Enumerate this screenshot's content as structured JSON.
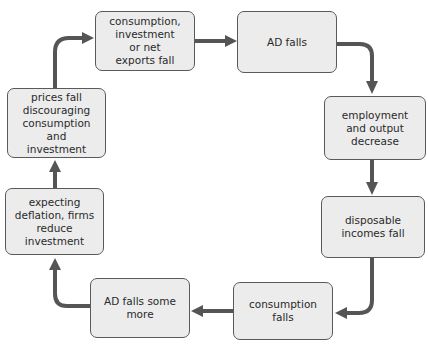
{
  "diagram": {
    "type": "cycle-flowchart",
    "colors": {
      "box_fill": "#ececec",
      "box_border": "#5a5a5a",
      "arrow": "#555555",
      "text": "#2a2a2a"
    },
    "nodes": [
      {
        "id": "n1",
        "label": "consumption,\ninvestment\nor net\nexports fall"
      },
      {
        "id": "n2",
        "label": "AD falls"
      },
      {
        "id": "n3",
        "label": "employment\nand output\ndecrease"
      },
      {
        "id": "n4",
        "label": "disposable\nincomes fall"
      },
      {
        "id": "n5",
        "label": "consumption\nfalls"
      },
      {
        "id": "n6",
        "label": "AD falls some\nmore"
      },
      {
        "id": "n7",
        "label": "expecting\ndeflation, firms\nreduce investment"
      },
      {
        "id": "n8",
        "label": "prices fall\ndiscouraging\nconsumption and\ninvestment"
      }
    ],
    "edges": [
      {
        "from": "n1",
        "to": "n2"
      },
      {
        "from": "n2",
        "to": "n3"
      },
      {
        "from": "n3",
        "to": "n4"
      },
      {
        "from": "n4",
        "to": "n5"
      },
      {
        "from": "n5",
        "to": "n6"
      },
      {
        "from": "n6",
        "to": "n7"
      },
      {
        "from": "n7",
        "to": "n8"
      },
      {
        "from": "n8",
        "to": "n1"
      }
    ]
  }
}
